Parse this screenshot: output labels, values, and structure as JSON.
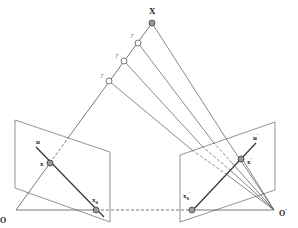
{
  "diagram": {
    "labels": {
      "X": "X",
      "q1": "?",
      "q2": "?",
      "q3": "?",
      "u": "u",
      "x": "x",
      "x0": "x",
      "x0_sub": "0",
      "O": "O",
      "u_prime": "u",
      "x_prime": "x",
      "x0_prime": "x",
      "x0_prime_sub": "0",
      "O_prime": "O",
      "prime": "′"
    },
    "colors": {
      "line": "#555555",
      "plane": "#777777",
      "point_fill": "#999999"
    }
  }
}
